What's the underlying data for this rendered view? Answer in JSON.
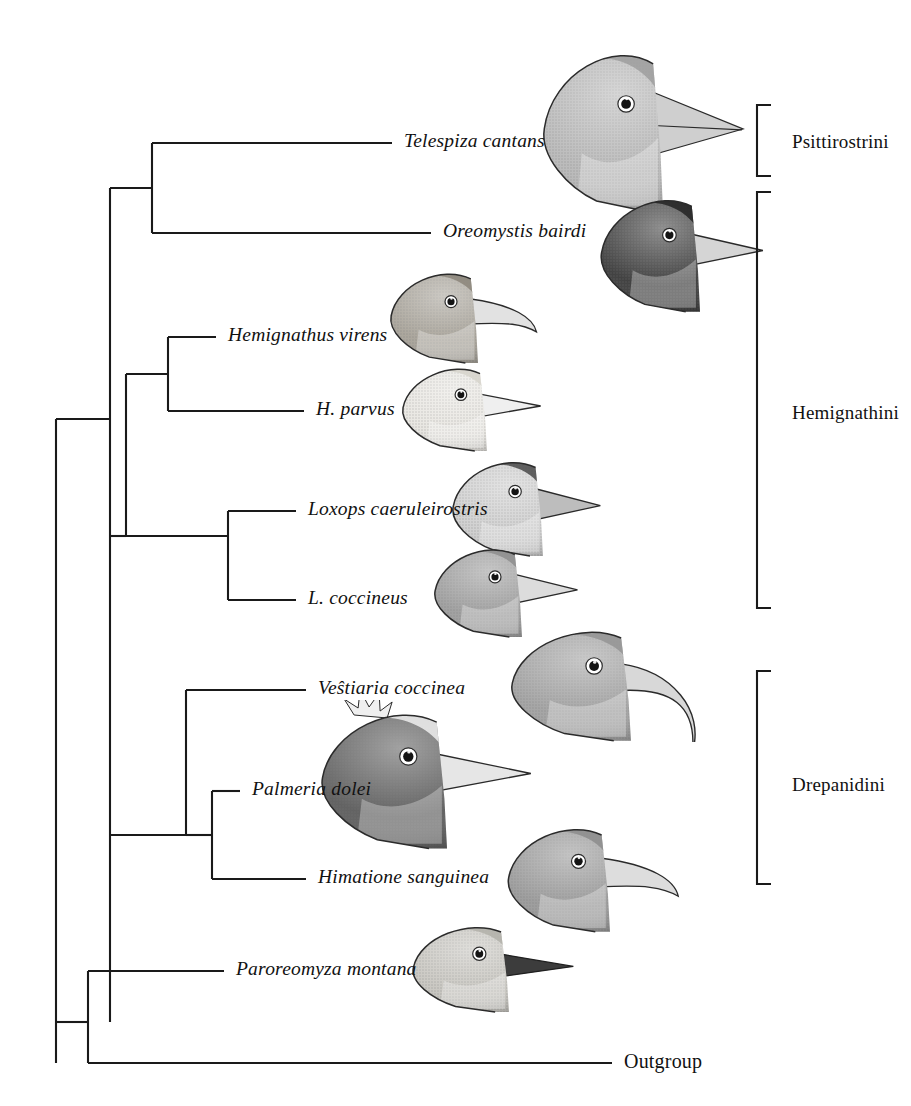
{
  "figure": {
    "type": "cladogram",
    "title": "",
    "caption": "",
    "background": "#ffffff",
    "line_color": "#1a1a1a"
  },
  "tips": [
    {
      "id": "telespiza",
      "label": "Telespiza cantans",
      "italic": true,
      "x": 404,
      "y": 143,
      "branch_x": 152
    },
    {
      "id": "oreomystis",
      "label": "Oreomystis bairdi",
      "italic": true,
      "x": 443,
      "y": 233,
      "branch_x": 152
    },
    {
      "id": "hem_virens",
      "label": "Hemignathus virens",
      "italic": true,
      "x": 228,
      "y": 337,
      "branch_x": 168
    },
    {
      "id": "h_parvus",
      "label": "H. parvus",
      "italic": true,
      "x": 316,
      "y": 411,
      "branch_x": 168
    },
    {
      "id": "loxops_caer",
      "label": "Loxops caeruleirostris",
      "italic": true,
      "x": 308,
      "y": 511,
      "branch_x": 228
    },
    {
      "id": "l_coccineus",
      "label": "L. coccineus",
      "italic": true,
      "x": 308,
      "y": 600,
      "branch_x": 228
    },
    {
      "id": "vestiaria",
      "label": "Veŝtiaria coccinea",
      "italic": true,
      "x": 318,
      "y": 690,
      "branch_x": 186
    },
    {
      "id": "palmeria",
      "label": "Palmeria dolei",
      "italic": true,
      "x": 252,
      "y": 791,
      "branch_x": 212
    },
    {
      "id": "himatione",
      "label": "Himatione sanguinea",
      "italic": true,
      "x": 318,
      "y": 879,
      "branch_x": 212
    },
    {
      "id": "paroreomyza",
      "label": "Paroreomyza montana",
      "italic": true,
      "x": 236,
      "y": 971,
      "branch_x": 88
    },
    {
      "id": "outgroup",
      "label": "Outgroup",
      "italic": false,
      "x": 624,
      "y": 1063,
      "branch_x": 88
    }
  ],
  "clades": [
    {
      "id": "psittirostrini",
      "label": "Psittirostrini",
      "label_x": 792,
      "label_y": 143,
      "bracket_x": 757,
      "bracket_top": 105,
      "bracket_bottom": 176
    },
    {
      "id": "hemignathini",
      "label": "Hemignathini",
      "label_x": 792,
      "label_y": 414,
      "bracket_x": 757,
      "bracket_top": 192,
      "bracket_bottom": 608
    },
    {
      "id": "drepanidini",
      "label": "Drepanidini",
      "label_x": 792,
      "label_y": 786,
      "bracket_x": 757,
      "bracket_top": 671,
      "bracket_bottom": 884
    }
  ],
  "tree_edges": {
    "description": "Rectangular cladogram; vertical connectors at node x positions.",
    "nodes": [
      {
        "id": "root",
        "x": 56,
        "y_top": 419,
        "y_bottom": 1063
      },
      {
        "id": "honeycreepers",
        "x": 88,
        "y_top": 971,
        "y_bottom": 1063
      },
      {
        "id": "core_clade",
        "x": 110,
        "y_top": 188,
        "y_bottom": 1022
      },
      {
        "id": "psitt_node",
        "x": 152,
        "y_top": 143,
        "y_bottom": 233
      },
      {
        "id": "hem_lox_node",
        "x": 126,
        "y_top": 374,
        "y_bottom": 536
      },
      {
        "id": "hemignathus",
        "x": 168,
        "y_top": 337,
        "y_bottom": 411
      },
      {
        "id": "loxops",
        "x": 228,
        "y_top": 511,
        "y_bottom": 600
      },
      {
        "id": "drep_node",
        "x": 186,
        "y_top": 690,
        "y_bottom": 835
      },
      {
        "id": "palm_hima",
        "x": 212,
        "y_top": 791,
        "y_bottom": 879
      }
    ]
  },
  "birds": [
    {
      "id": "bird-telespiza",
      "species": "Telespiza cantans",
      "x": 540,
      "y": 38,
      "w": 205,
      "h": 175,
      "tone": "#b9b9b9",
      "crown": "#9d9d9d",
      "bill": "#cfcfcf",
      "bill_style": "conical-large"
    },
    {
      "id": "bird-oreomystis",
      "species": "Oreomystis bairdi",
      "x": 598,
      "y": 188,
      "w": 170,
      "h": 125,
      "tone": "#3a3a3a",
      "crown": "#232323",
      "bill": "#d5d5d5",
      "bill_style": "straight-short"
    },
    {
      "id": "bird-hemignathus",
      "species": "Hemignathus virens",
      "x": 388,
      "y": 264,
      "w": 150,
      "h": 100,
      "tone": "#a8a399",
      "crown": "#8b857a",
      "bill": "#e2e2e2",
      "bill_style": "decurved-medium"
    },
    {
      "id": "bird-hparvus",
      "species": "H. parvus",
      "x": 400,
      "y": 360,
      "w": 145,
      "h": 92,
      "tone": "#e8e6e1",
      "crown": "#d6d3cb",
      "bill": "#efefef",
      "bill_style": "straight-short"
    },
    {
      "id": "bird-loxops-caer",
      "species": "Loxops caeruleirostris",
      "x": 450,
      "y": 452,
      "w": 155,
      "h": 105,
      "tone": "#cfcfcf",
      "crown": "#4a4a4a",
      "bill": "#bdbdbd",
      "bill_style": "conical-small"
    },
    {
      "id": "bird-lcoccineus",
      "species": "L. coccineus",
      "x": 432,
      "y": 540,
      "w": 150,
      "h": 98,
      "tone": "#9e9e9e",
      "crown": "#8d8d8d",
      "bill": "#dcdcdc",
      "bill_style": "conical-small"
    },
    {
      "id": "bird-vestiaria",
      "species": "Veŝtiaria coccinea",
      "x": 508,
      "y": 620,
      "w": 205,
      "h": 122,
      "tone": "#a2a2a2",
      "crown": "#949494",
      "bill": "#d8d8d8",
      "bill_style": "long-decurved"
    },
    {
      "id": "bird-palmeria",
      "species": "Palmeria dolei",
      "x": 318,
      "y": 700,
      "w": 215,
      "h": 150,
      "tone": "#5c5c5c",
      "crown": "#efefef",
      "bill": "#e6e6e6",
      "bill_style": "straight-crest"
    },
    {
      "id": "bird-himatione",
      "species": "Himatione sanguinea",
      "x": 505,
      "y": 818,
      "w": 175,
      "h": 115,
      "tone": "#9a9a9a",
      "crown": "#8c8c8c",
      "bill": "#dddddd",
      "bill_style": "decurved-medium"
    },
    {
      "id": "bird-paroreomyza",
      "species": "Paroreomyza montana",
      "x": 410,
      "y": 918,
      "w": 165,
      "h": 95,
      "tone": "#c8c6c0",
      "crown": "#b2b0a9",
      "bill": "#3c3c3c",
      "bill_style": "straight-dark"
    }
  ]
}
